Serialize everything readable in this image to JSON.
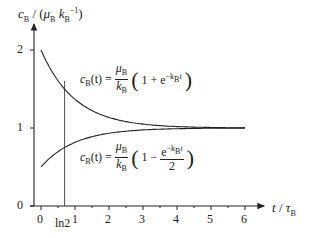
{
  "chart_data": {
    "type": "line",
    "title": "",
    "xlabel": "t / τB",
    "ylabel": "cB / (μB kB⁻¹)",
    "xlim": [
      -0.2,
      6.5
    ],
    "ylim": [
      0,
      2.3
    ],
    "x_ticks": [
      "0",
      "1",
      "2",
      "3",
      "4",
      "5",
      "6"
    ],
    "y_ticks": [
      "0",
      "1",
      "2"
    ],
    "grid": false,
    "annotations": [
      {
        "type": "vline",
        "x": 0.693,
        "label": "ln2"
      }
    ],
    "series": [
      {
        "name": "cB(t) = μB/kB (1 + e^(−kB t))",
        "x": [
          0,
          0.5,
          0.693,
          1,
          1.5,
          2,
          3,
          4,
          5,
          6
        ],
        "values": [
          2.0,
          1.61,
          1.5,
          1.37,
          1.22,
          1.14,
          1.05,
          1.02,
          1.01,
          1.0
        ]
      },
      {
        "name": "cB(t) = μB/kB (1 − e^(−kB t)/2)",
        "x": [
          0,
          0.5,
          0.693,
          1,
          1.5,
          2,
          3,
          4,
          5,
          6
        ],
        "values": [
          0.5,
          0.7,
          0.75,
          0.82,
          0.89,
          0.93,
          0.98,
          0.99,
          1.0,
          1.0
        ]
      }
    ]
  },
  "labels": {
    "y_axis_c": "c",
    "y_axis_sub": "B",
    "y_axis_rest": " / (",
    "y_axis_mu": "μ",
    "y_axis_mu_sub": "B",
    "y_axis_k": " k",
    "y_axis_k_sub": "B",
    "y_axis_k_sup": "−1",
    "y_axis_close": ")",
    "x_axis_t": "t",
    "x_axis_slash": " / ",
    "x_axis_tau": "τ",
    "x_axis_tau_sub": "B",
    "ln2": "ln2",
    "y0": "0",
    "y1": "1",
    "y2": "2",
    "x0": "0",
    "x1": "1",
    "x2": "2",
    "x3": "3",
    "x4": "4",
    "x5": "5",
    "x6": "6"
  },
  "formula_upper": {
    "lhs_c": "c",
    "lhs_sub": "B",
    "lhs_arg": "(t)",
    "eq": "=",
    "num": "μ",
    "num_sub": "B",
    "den": "k",
    "den_sub": "B",
    "open": "(",
    "body": "1 + e",
    "exp": "−k",
    "exp_sub": "B",
    "exp_t": "t",
    "close": ")"
  },
  "formula_lower": {
    "lhs_c": "c",
    "lhs_sub": "B",
    "lhs_arg": "(t)",
    "eq": "=",
    "num": "μ",
    "num_sub": "B",
    "den": "k",
    "den_sub": "B",
    "open": "(",
    "body": "1 −",
    "frac_num": "e",
    "exp": "−k",
    "exp_sub": "B",
    "exp_t": "t",
    "frac_den": "2",
    "close": ")"
  }
}
